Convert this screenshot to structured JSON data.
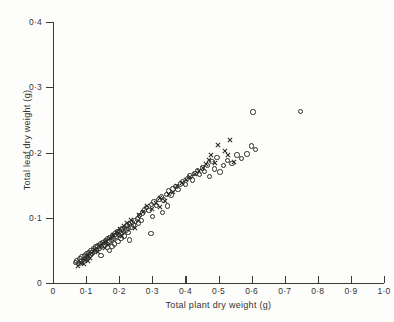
{
  "chart_data": {
    "type": "scatter",
    "title": "",
    "xlabel": "Total plant dry weight (g)",
    "ylabel": "Total leaf dry weight (g)",
    "xlim": [
      0,
      1.0
    ],
    "ylim": [
      0,
      0.4
    ],
    "xticks": [
      "0",
      "0·1",
      "0·2",
      "0·3",
      "0·4",
      "0·5",
      "0·6",
      "0·7",
      "0·8",
      "0·9",
      "1·0"
    ],
    "xtick_values": [
      0,
      0.1,
      0.2,
      0.3,
      0.4,
      0.5,
      0.6,
      0.7,
      0.8,
      0.9,
      1.0
    ],
    "yticks": [
      "0",
      "0·1",
      "0·2",
      "0·3",
      "0·4"
    ],
    "ytick_values": [
      0,
      0.1,
      0.2,
      0.3,
      0.4
    ],
    "grid": false,
    "legend": "none",
    "marker_colors": {
      "circle": "#2a2a28",
      "cross": "#2a2a28"
    },
    "series": [
      {
        "name": "open circle",
        "marker": "circle",
        "points": [
          [
            0.068,
            0.031
          ],
          [
            0.073,
            0.034
          ],
          [
            0.078,
            0.03
          ],
          [
            0.081,
            0.037
          ],
          [
            0.085,
            0.033
          ],
          [
            0.088,
            0.04
          ],
          [
            0.092,
            0.036
          ],
          [
            0.095,
            0.042
          ],
          [
            0.099,
            0.038
          ],
          [
            0.101,
            0.045
          ],
          [
            0.104,
            0.041
          ],
          [
            0.108,
            0.047
          ],
          [
            0.112,
            0.043
          ],
          [
            0.115,
            0.05
          ],
          [
            0.118,
            0.046
          ],
          [
            0.122,
            0.052
          ],
          [
            0.126,
            0.048
          ],
          [
            0.129,
            0.055
          ],
          [
            0.132,
            0.051
          ],
          [
            0.136,
            0.057
          ],
          [
            0.14,
            0.053
          ],
          [
            0.143,
            0.06
          ],
          [
            0.147,
            0.056
          ],
          [
            0.151,
            0.062
          ],
          [
            0.154,
            0.058
          ],
          [
            0.158,
            0.065
          ],
          [
            0.161,
            0.061
          ],
          [
            0.165,
            0.068
          ],
          [
            0.169,
            0.063
          ],
          [
            0.172,
            0.07
          ],
          [
            0.176,
            0.066
          ],
          [
            0.18,
            0.073
          ],
          [
            0.183,
            0.069
          ],
          [
            0.187,
            0.075
          ],
          [
            0.19,
            0.071
          ],
          [
            0.194,
            0.078
          ],
          [
            0.198,
            0.074
          ],
          [
            0.201,
            0.08
          ],
          [
            0.205,
            0.076
          ],
          [
            0.209,
            0.083
          ],
          [
            0.213,
            0.079
          ],
          [
            0.216,
            0.085
          ],
          [
            0.22,
            0.081
          ],
          [
            0.224,
            0.088
          ],
          [
            0.228,
            0.084
          ],
          [
            0.232,
            0.09
          ],
          [
            0.236,
            0.086
          ],
          [
            0.24,
            0.093
          ],
          [
            0.244,
            0.089
          ],
          [
            0.248,
            0.095
          ],
          [
            0.17,
            0.05
          ],
          [
            0.178,
            0.056
          ],
          [
            0.186,
            0.06
          ],
          [
            0.196,
            0.064
          ],
          [
            0.206,
            0.068
          ],
          [
            0.215,
            0.072
          ],
          [
            0.226,
            0.077
          ],
          [
            0.255,
            0.098
          ],
          [
            0.262,
            0.103
          ],
          [
            0.27,
            0.107
          ],
          [
            0.258,
            0.092
          ],
          [
            0.266,
            0.096
          ],
          [
            0.276,
            0.112
          ],
          [
            0.283,
            0.116
          ],
          [
            0.29,
            0.111
          ],
          [
            0.298,
            0.12
          ],
          [
            0.305,
            0.124
          ],
          [
            0.312,
            0.119
          ],
          [
            0.32,
            0.128
          ],
          [
            0.327,
            0.132
          ],
          [
            0.334,
            0.127
          ],
          [
            0.342,
            0.136
          ],
          [
            0.349,
            0.141
          ],
          [
            0.356,
            0.135
          ],
          [
            0.363,
            0.144
          ],
          [
            0.371,
            0.148
          ],
          [
            0.378,
            0.143
          ],
          [
            0.385,
            0.152
          ],
          [
            0.392,
            0.156
          ],
          [
            0.4,
            0.151
          ],
          [
            0.407,
            0.16
          ],
          [
            0.414,
            0.164
          ],
          [
            0.421,
            0.158
          ],
          [
            0.429,
            0.168
          ],
          [
            0.436,
            0.172
          ],
          [
            0.443,
            0.166
          ],
          [
            0.451,
            0.176
          ],
          [
            0.458,
            0.171
          ],
          [
            0.466,
            0.18
          ],
          [
            0.33,
            0.108
          ],
          [
            0.345,
            0.118
          ],
          [
            0.301,
            0.102
          ],
          [
            0.472,
            0.163
          ],
          [
            0.48,
            0.186
          ],
          [
            0.488,
            0.175
          ],
          [
            0.496,
            0.192
          ],
          [
            0.505,
            0.17
          ],
          [
            0.516,
            0.18
          ],
          [
            0.528,
            0.188
          ],
          [
            0.541,
            0.183
          ],
          [
            0.556,
            0.196
          ],
          [
            0.57,
            0.191
          ],
          [
            0.586,
            0.198
          ],
          [
            0.6,
            0.21
          ],
          [
            0.612,
            0.205
          ],
          [
            0.604,
            0.262
          ],
          [
            0.748,
            0.263
          ],
          [
            0.296,
            0.076
          ],
          [
            0.231,
            0.066
          ],
          [
            0.145,
            0.042
          ]
        ]
      },
      {
        "name": "cross",
        "marker": "cross",
        "points": [
          [
            0.075,
            0.026
          ],
          [
            0.086,
            0.031
          ],
          [
            0.097,
            0.036
          ],
          [
            0.107,
            0.041
          ],
          [
            0.118,
            0.046
          ],
          [
            0.128,
            0.051
          ],
          [
            0.139,
            0.056
          ],
          [
            0.15,
            0.061
          ],
          [
            0.16,
            0.064
          ],
          [
            0.171,
            0.069
          ],
          [
            0.181,
            0.073
          ],
          [
            0.192,
            0.078
          ],
          [
            0.113,
            0.038
          ],
          [
            0.135,
            0.047
          ],
          [
            0.156,
            0.054
          ],
          [
            0.203,
            0.083
          ],
          [
            0.214,
            0.088
          ],
          [
            0.224,
            0.092
          ],
          [
            0.236,
            0.097
          ],
          [
            0.248,
            0.085
          ],
          [
            0.26,
            0.104
          ],
          [
            0.272,
            0.109
          ],
          [
            0.285,
            0.118
          ],
          [
            0.298,
            0.113
          ],
          [
            0.311,
            0.122
          ],
          [
            0.324,
            0.131
          ],
          [
            0.337,
            0.126
          ],
          [
            0.35,
            0.136
          ],
          [
            0.363,
            0.14
          ],
          [
            0.376,
            0.149
          ],
          [
            0.389,
            0.153
          ],
          [
            0.402,
            0.158
          ],
          [
            0.415,
            0.162
          ],
          [
            0.428,
            0.167
          ],
          [
            0.441,
            0.171
          ],
          [
            0.454,
            0.176
          ],
          [
            0.463,
            0.182
          ],
          [
            0.47,
            0.188
          ],
          [
            0.478,
            0.196
          ],
          [
            0.49,
            0.184
          ],
          [
            0.498,
            0.212
          ],
          [
            0.519,
            0.202
          ],
          [
            0.529,
            0.196
          ],
          [
            0.536,
            0.219
          ],
          [
            0.546,
            0.186
          ],
          [
            0.094,
            0.029
          ],
          [
            0.105,
            0.034
          ],
          [
            0.165,
            0.058
          ],
          [
            0.208,
            0.072
          ],
          [
            0.322,
            0.116
          ]
        ]
      }
    ]
  }
}
